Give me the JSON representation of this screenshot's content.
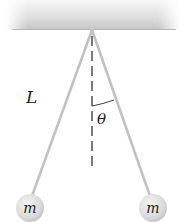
{
  "diagram": {
    "type": "pendulum",
    "labels": {
      "length": "L",
      "angle": "θ",
      "left_mass": "m",
      "right_mass": "m"
    },
    "colors": {
      "ceiling_top": "#f2f2f2",
      "ceiling_bottom": "#c8c8c8",
      "rod": "#bdbdbd",
      "dashed_line": "#444444",
      "bob_light": "#ededed",
      "bob_dark": "#bdbdbd",
      "text": "#222222"
    }
  }
}
